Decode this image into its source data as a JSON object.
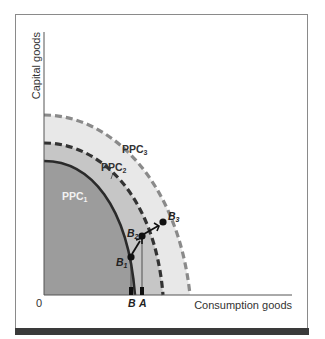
{
  "figure": {
    "y_axis_label": "Capital goods",
    "x_axis_label": "Consumption goods",
    "origin_label": "0",
    "curves": [
      {
        "name": "PPC",
        "sub": "1",
        "style": "solid"
      },
      {
        "name": "PPC",
        "sub": "2",
        "style": "dashed"
      },
      {
        "name": "PPC",
        "sub": "3",
        "style": "dashed-light"
      }
    ],
    "points": [
      {
        "name": "B",
        "sub": "1"
      },
      {
        "name": "B",
        "sub": "2"
      },
      {
        "name": "B",
        "sub": "3"
      }
    ],
    "axis_markers": [
      {
        "label": "B"
      },
      {
        "label": "A"
      }
    ],
    "colors": {
      "ppc1_fill": "#9a9a9a",
      "ppc2_fill": "#c4c4c4",
      "ppc3_fill": "#e8e8e8",
      "ppc1_line": "#2a2a2a",
      "ppc2_line": "#3a3a3a",
      "ppc3_line": "#8a8a8a"
    }
  }
}
